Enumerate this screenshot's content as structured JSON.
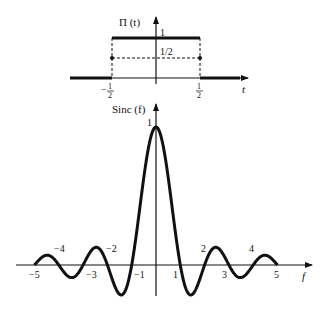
{
  "rect_plot": {
    "ylabel": "Π (t)",
    "xlabel": "t",
    "level_one": "1",
    "level_half": "1/2",
    "left_tick_num": "1",
    "left_tick_den": "2",
    "left_tick_sign": "−",
    "right_tick_num": "1",
    "right_tick_den": "2"
  },
  "sinc_plot": {
    "ylabel": "Sinc (f)",
    "xlabel": "f",
    "peak_label": "1",
    "ticks": {
      "m5": "−5",
      "m4": "−4",
      "m3": "−3",
      "m2": "−2",
      "m1": "−1",
      "p1": "1",
      "p2": "2",
      "p3": "3",
      "p4": "4",
      "p5": "5"
    }
  },
  "chart_data": [
    {
      "type": "line",
      "title": "Π(t)",
      "xlabel": "t",
      "ylabel": "Π(t)",
      "x": [
        -0.5,
        -0.5,
        0.5,
        0.5
      ],
      "values": [
        0,
        1,
        1,
        0
      ],
      "annotations": [
        "value 1/2 at t = ±1/2 (dashed)"
      ],
      "xlim": [
        -0.75,
        0.75
      ],
      "ylim": [
        0,
        1
      ]
    },
    {
      "type": "line",
      "title": "Sinc(f)",
      "xlabel": "f",
      "ylabel": "Sinc(f)",
      "function": "sin(πf)/(πf)",
      "xlim": [
        -5,
        5
      ],
      "ylim": [
        -0.22,
        1
      ],
      "zeros": [
        -5,
        -4,
        -3,
        -2,
        -1,
        1,
        2,
        3,
        4,
        5
      ],
      "peak": 1
    }
  ]
}
